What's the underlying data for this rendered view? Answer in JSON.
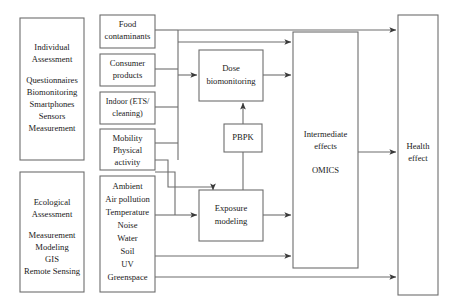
{
  "diagram": {
    "type": "flow-diagram",
    "orientation": "left-to-right",
    "line_color": "#6d6d6d",
    "box_fill": "#ffffff",
    "text_color": "#1a1a1a",
    "nodes": {
      "individual_assessment": {
        "name": "individual-assessment-box",
        "heading": [
          "Individual",
          "Assessment"
        ],
        "items": [
          "Questionnaires",
          "Biomonitoring",
          "Smartphones",
          "Sensors",
          "Measurement"
        ]
      },
      "ecological_assessment": {
        "name": "ecological-assessment-box",
        "heading": [
          "Ecological",
          "Assessment"
        ],
        "items": [
          "Measurement",
          "Modeling",
          "GIS",
          "Remote Sensing"
        ]
      },
      "food_contaminants": {
        "lines": [
          "Food",
          "contaminants"
        ]
      },
      "consumer_products": {
        "lines": [
          "Consumer",
          "products"
        ]
      },
      "indoor": {
        "lines": [
          "Indoor (ETS/",
          "cleaning)"
        ]
      },
      "mobility": {
        "lines": [
          "Mobility",
          "Physical",
          "activity"
        ]
      },
      "ambient": {
        "lines": [
          "Ambient",
          "Air pollution",
          "Temperature",
          "Noise",
          "Water",
          "Soil",
          "UV",
          "Greenspace"
        ]
      },
      "dose_biomonitoring": {
        "lines": [
          "Dose",
          "biomonitoring"
        ]
      },
      "pbpk": {
        "lines": [
          "PBPK"
        ]
      },
      "exposure_modeling": {
        "lines": [
          "Exposure",
          "modeling"
        ]
      },
      "intermediate_effects": {
        "lines": [
          "Intermediate",
          "effects",
          "",
          "OMICS"
        ]
      },
      "health_effect": {
        "lines": [
          "Health",
          "effect"
        ]
      }
    },
    "edges": [
      {
        "from": "exposure-sources-bus",
        "to": "health-effect",
        "label": ""
      },
      {
        "from": "exposure-sources-bus",
        "to": "intermediate-effects",
        "label": ""
      },
      {
        "from": "exposure-sources-bus",
        "to": "dose-biomonitoring",
        "label": ""
      },
      {
        "from": "dose-biomonitoring",
        "to": "intermediate-effects",
        "label": ""
      },
      {
        "from": "pbpk",
        "to": "dose-biomonitoring",
        "label": ""
      },
      {
        "from": "pbpk",
        "to": "exposure-modeling",
        "label": ""
      },
      {
        "from": "mobility-bus",
        "to": "exposure-modeling",
        "label": ""
      },
      {
        "from": "ambient",
        "to": "exposure-modeling",
        "label": ""
      },
      {
        "from": "exposure-modeling",
        "to": "intermediate-effects",
        "label": ""
      },
      {
        "from": "ambient",
        "to": "intermediate-effects",
        "label": ""
      },
      {
        "from": "ambient",
        "to": "health-effect",
        "label": ""
      },
      {
        "from": "intermediate-effects",
        "to": "health-effect",
        "label": ""
      }
    ]
  }
}
